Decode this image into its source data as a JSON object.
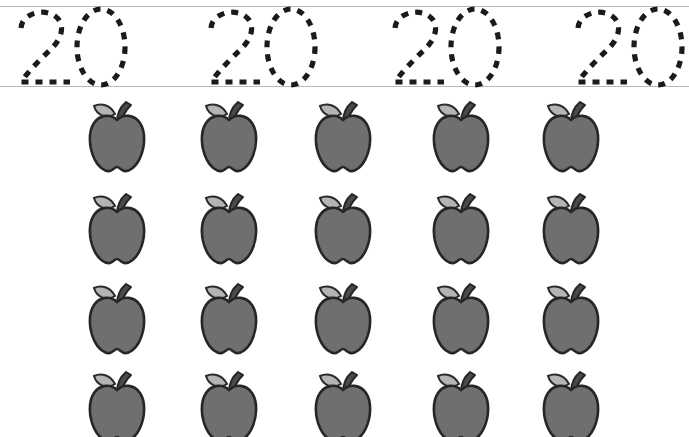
{
  "worksheet": {
    "title": "Number 20 Tracing and Counting Worksheet",
    "width": 689,
    "height": 437,
    "background_color": "#ffffff"
  },
  "tracing_row": {
    "name": "number-tracing-row",
    "numeral": "20",
    "repetitions": 4,
    "style": "dashed-outline",
    "stroke_color": "#1a1a1a",
    "guide_lines": {
      "color": "#b8b8b8",
      "top_y": 6,
      "baseline_y": 86
    },
    "items": [
      {
        "label": "20",
        "digits": [
          "2",
          "0"
        ],
        "x": 8
      },
      {
        "label": "20",
        "digits": [
          "2",
          "0"
        ],
        "x": 198
      },
      {
        "label": "20",
        "digits": [
          "2",
          "0"
        ],
        "x": 382
      },
      {
        "label": "20",
        "digits": [
          "2",
          "0"
        ],
        "x": 565
      }
    ]
  },
  "counting_grid": {
    "name": "apple-counting-grid",
    "item_name": "apple",
    "rows": 4,
    "columns": 5,
    "total_count": 20,
    "colors": {
      "body_fill": "#6f6f6f",
      "body_outline": "#262626",
      "leaf_fill": "#b4b4b4",
      "leaf_outline": "#2a2a2a",
      "stem_fill": "#4a4a4a"
    },
    "row_y": [
      0,
      92,
      182,
      270
    ],
    "column_x": [
      84,
      196,
      310,
      428,
      538
    ]
  }
}
